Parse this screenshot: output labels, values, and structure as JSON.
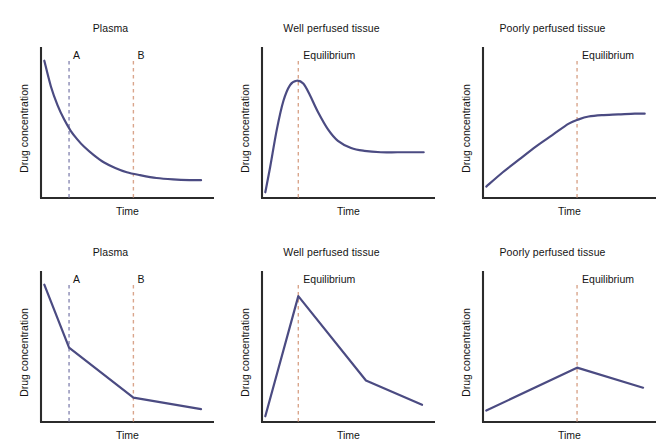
{
  "figure": {
    "background": "#ffffff",
    "curve_color": "#4b4b82",
    "axis_color": "#2b2b2b",
    "marker_a_color": "#8a8ab4",
    "marker_b_color": "#d9a58c",
    "equilibrium_color": "#d9a58c",
    "rows": 2,
    "cols": 3
  },
  "axes": {
    "xlabel": "Time",
    "ylabel": "Drug concentration"
  },
  "markers": {
    "a_label": "A",
    "b_label": "B",
    "equilibrium_label": "Equilibrium"
  },
  "panels": [
    {
      "id": "top-plasma",
      "title": "Plasma",
      "row": 0,
      "col": 0,
      "style": "smooth"
    },
    {
      "id": "top-well-perfused",
      "title": "Well perfused tissue",
      "row": 0,
      "col": 1,
      "style": "smooth"
    },
    {
      "id": "top-poorly-perfused",
      "title": "Poorly perfused tissue",
      "row": 0,
      "col": 2,
      "style": "smooth"
    },
    {
      "id": "bottom-plasma",
      "title": "Plasma",
      "row": 1,
      "col": 0,
      "style": "piecewise"
    },
    {
      "id": "bottom-well-perfused",
      "title": "Well perfused tissue",
      "row": 1,
      "col": 1,
      "style": "piecewise"
    },
    {
      "id": "bottom-poorly-perfused",
      "title": "Poorly perfused tissue",
      "row": 1,
      "col": 2,
      "style": "piecewise"
    }
  ],
  "chart_data": [
    {
      "type": "line",
      "id": "top-plasma",
      "title": "Plasma",
      "xlabel": "Time",
      "ylabel": "Drug concentration",
      "xlim": [
        0,
        100
      ],
      "ylim": [
        0,
        100
      ],
      "grid": false,
      "legend": "none",
      "description": "Monoexponential decline of plasma drug concentration to a low plateau",
      "series": [
        {
          "name": "Plasma concentration",
          "color": "#4b4b82",
          "x": [
            2,
            6,
            10,
            14,
            18,
            22,
            26,
            32,
            38,
            45,
            52,
            60,
            70,
            80,
            90,
            97
          ],
          "y": [
            96,
            78,
            65,
            55,
            47,
            41,
            36,
            30,
            25,
            21,
            18,
            16,
            14,
            13,
            12.5,
            12.5
          ]
        }
      ],
      "annotations": [
        {
          "label": "A",
          "type": "vline",
          "x": 17,
          "color": "#8a8ab4",
          "style": "dashed"
        },
        {
          "label": "B",
          "type": "vline",
          "x": 56,
          "color": "#d9a58c",
          "style": "dashed"
        }
      ]
    },
    {
      "type": "line",
      "id": "top-well-perfused",
      "title": "Well perfused tissue",
      "xlabel": "Time",
      "ylabel": "Drug concentration",
      "xlim": [
        0,
        100
      ],
      "ylim": [
        0,
        100
      ],
      "grid": false,
      "legend": "none",
      "description": "Rapid rise to an overshoot peak at equilibrium, then decline to a steady plateau",
      "series": [
        {
          "name": "Well perfused tissue concentration",
          "color": "#4b4b82",
          "x": [
            2,
            5,
            9,
            13,
            17,
            21,
            25,
            29,
            34,
            40,
            46,
            54,
            62,
            72,
            82,
            92,
            98
          ],
          "y": [
            4,
            22,
            48,
            68,
            79,
            82,
            80,
            72,
            60,
            48,
            40,
            35,
            33,
            32,
            32,
            32,
            32
          ]
        }
      ],
      "annotations": [
        {
          "label": "Equilibrium",
          "type": "vline",
          "x": 22,
          "color": "#d9a58c",
          "style": "dashed"
        }
      ]
    },
    {
      "type": "line",
      "id": "top-poorly-perfused",
      "title": "Poorly perfused tissue",
      "xlabel": "Time",
      "ylabel": "Drug concentration",
      "xlim": [
        0,
        100
      ],
      "ylim": [
        0,
        100
      ],
      "grid": false,
      "legend": "none",
      "description": "Slow near-linear rise reaching a plateau at equilibrium",
      "series": [
        {
          "name": "Poorly perfused tissue concentration",
          "color": "#4b4b82",
          "x": [
            2,
            12,
            22,
            32,
            42,
            52,
            58,
            64,
            72,
            82,
            92,
            98
          ],
          "y": [
            8,
            18,
            27,
            36,
            44,
            52,
            55,
            57,
            58,
            58.5,
            59,
            59
          ]
        }
      ],
      "annotations": [
        {
          "label": "Equilibrium",
          "type": "vline",
          "x": 57,
          "color": "#d9a58c",
          "style": "dashed"
        }
      ]
    },
    {
      "type": "line",
      "id": "bottom-plasma",
      "title": "Plasma",
      "xlabel": "Time",
      "ylabel": "Drug concentration",
      "xlim": [
        0,
        100
      ],
      "ylim": [
        0,
        100
      ],
      "grid": false,
      "legend": "none",
      "description": "Piecewise-linear plasma decline with breakpoints at A and B",
      "series": [
        {
          "name": "Plasma concentration",
          "color": "#4b4b82",
          "x": [
            2,
            17,
            56,
            97
          ],
          "y": [
            96,
            52,
            17,
            9
          ]
        }
      ],
      "annotations": [
        {
          "label": "A",
          "type": "vline",
          "x": 17,
          "color": "#8a8ab4",
          "style": "dashed"
        },
        {
          "label": "B",
          "type": "vline",
          "x": 56,
          "color": "#d9a58c",
          "style": "dashed"
        }
      ]
    },
    {
      "type": "line",
      "id": "bottom-well-perfused",
      "title": "Well perfused tissue",
      "xlabel": "Time",
      "ylabel": "Drug concentration",
      "xlim": [
        0,
        100
      ],
      "ylim": [
        0,
        100
      ],
      "grid": false,
      "legend": "none",
      "description": "Piecewise-linear rise to a sharp peak at equilibrium followed by two-phase decline",
      "series": [
        {
          "name": "Well perfused tissue concentration",
          "color": "#4b4b82",
          "x": [
            2,
            22,
            63,
            97
          ],
          "y": [
            4,
            88,
            29,
            12
          ]
        }
      ],
      "annotations": [
        {
          "label": "Equilibrium",
          "type": "vline",
          "x": 22,
          "color": "#d9a58c",
          "style": "dashed"
        }
      ]
    },
    {
      "type": "line",
      "id": "bottom-poorly-perfused",
      "title": "Poorly perfused tissue",
      "xlabel": "Time",
      "ylabel": "Drug concentration",
      "xlim": [
        0,
        100
      ],
      "ylim": [
        0,
        100
      ],
      "grid": false,
      "legend": "none",
      "description": "Piecewise-linear slow rise to a shallow peak at equilibrium then gradual decline",
      "series": [
        {
          "name": "Poorly perfused tissue concentration",
          "color": "#4b4b82",
          "x": [
            2,
            57,
            97
          ],
          "y": [
            8,
            38,
            24
          ]
        }
      ],
      "annotations": [
        {
          "label": "Equilibrium",
          "type": "vline",
          "x": 57,
          "color": "#d9a58c",
          "style": "dashed"
        }
      ]
    }
  ]
}
